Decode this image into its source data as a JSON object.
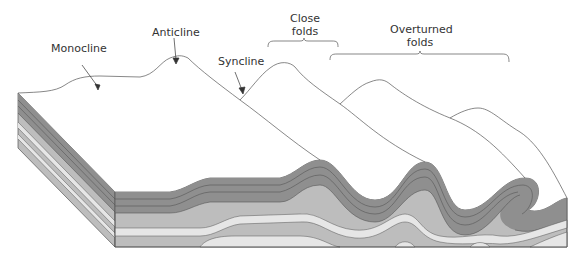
{
  "labels": {
    "monocline": "Monocline",
    "anticline": "Anticline",
    "syncline": "Syncline",
    "close_folds_line1": "Close",
    "close_folds_line2": "folds",
    "overturned_folds_line1": "Overturned",
    "overturned_folds_line2": "folds"
  },
  "colors": {
    "outline": "#555555",
    "dark_layer": "#8f8f8f",
    "mid_layer": "#bdbdbd",
    "light_layer": "#e6e6e6",
    "top_surface": "#ffffff"
  }
}
